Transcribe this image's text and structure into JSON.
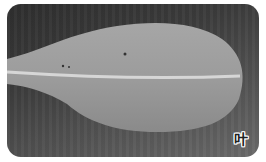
{
  "image": {
    "subject": "leaf",
    "description": "Grayscale photograph of a single elongated leaf with a visible midrib on a dark background",
    "label": "叶",
    "colors": {
      "background_dark": "#2e2e2e",
      "leaf": "#9a9a9a",
      "midrib": "#d8d8d8"
    }
  }
}
